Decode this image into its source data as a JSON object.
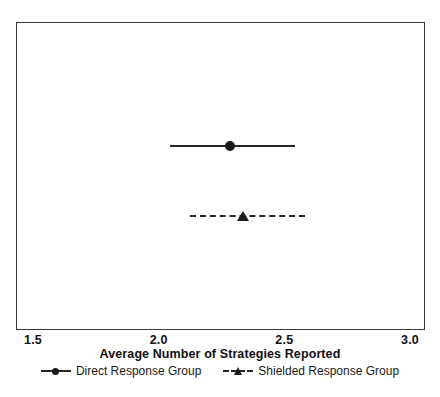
{
  "chart_data": {
    "type": "scatter",
    "title": "",
    "xlabel": "Average Number of Strategies Reported",
    "ylabel": "",
    "xlim": [
      1.5,
      3.0
    ],
    "xticks": [
      1.5,
      2.0,
      2.5,
      3.0
    ],
    "xticklabels": [
      "1.5",
      "2.0",
      "2.5",
      "3.0"
    ],
    "grid": false,
    "legend_position": "below-axis-title",
    "frame": true,
    "series": [
      {
        "name": "Direct Response Group",
        "marker": "circle",
        "linestyle": "solid",
        "color": "#1a1a1a",
        "mean": 2.28,
        "ci_low": 2.04,
        "ci_high": 2.54
      },
      {
        "name": "Shielded Response Group",
        "marker": "triangle",
        "linestyle": "dashed",
        "color": "#1a1a1a",
        "mean": 2.33,
        "ci_low": 2.12,
        "ci_high": 2.58
      }
    ]
  },
  "axis": {
    "title": "Average Number of Strategies Reported",
    "ticks": [
      {
        "label": "1.5",
        "value": 1.5
      },
      {
        "label": "2.0",
        "value": 2.0
      },
      {
        "label": "2.5",
        "value": 2.5
      },
      {
        "label": "3.0",
        "value": 3.0
      }
    ]
  },
  "legend": {
    "entries": [
      {
        "label": "Direct Response Group",
        "marker": "circle",
        "linestyle": "solid"
      },
      {
        "label": "Shielded Response Group",
        "marker": "triangle",
        "linestyle": "dashed"
      }
    ]
  },
  "colors": {
    "ink": "#1a1a1a",
    "line": "#262626",
    "frame": "#3a3a3a",
    "background": "#ffffff"
  }
}
